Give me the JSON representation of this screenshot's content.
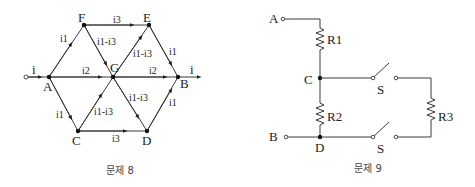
{
  "figures": [
    {
      "id": "problem-8",
      "caption": "문제 8",
      "type": "hexagonal current network",
      "nodes": {
        "A": "A",
        "B": "B",
        "C": "C",
        "D": "D",
        "E": "E",
        "F": "F",
        "G": "G"
      },
      "input_current": "i",
      "output_current": "i",
      "branch_currents": {
        "AF": "i1",
        "AG": "i2",
        "AC": "i1",
        "FE": "i3",
        "FG": "i1-i3",
        "GE": "i1-i3",
        "EB": "i1",
        "GB": "i2",
        "CG": "i1-i3",
        "CD": "i3",
        "GD": "i1-i3",
        "DB": "i1"
      }
    },
    {
      "id": "problem-9",
      "caption": "문제 9",
      "type": "resistor circuit with switches",
      "terminals": {
        "A": "A",
        "B": "B"
      },
      "nodes": {
        "C": "C",
        "D": "D"
      },
      "resistors": {
        "R1": "R1",
        "R2": "R2",
        "R3": "R3"
      },
      "switches": {
        "top": "S",
        "bottom": "S"
      }
    }
  ]
}
